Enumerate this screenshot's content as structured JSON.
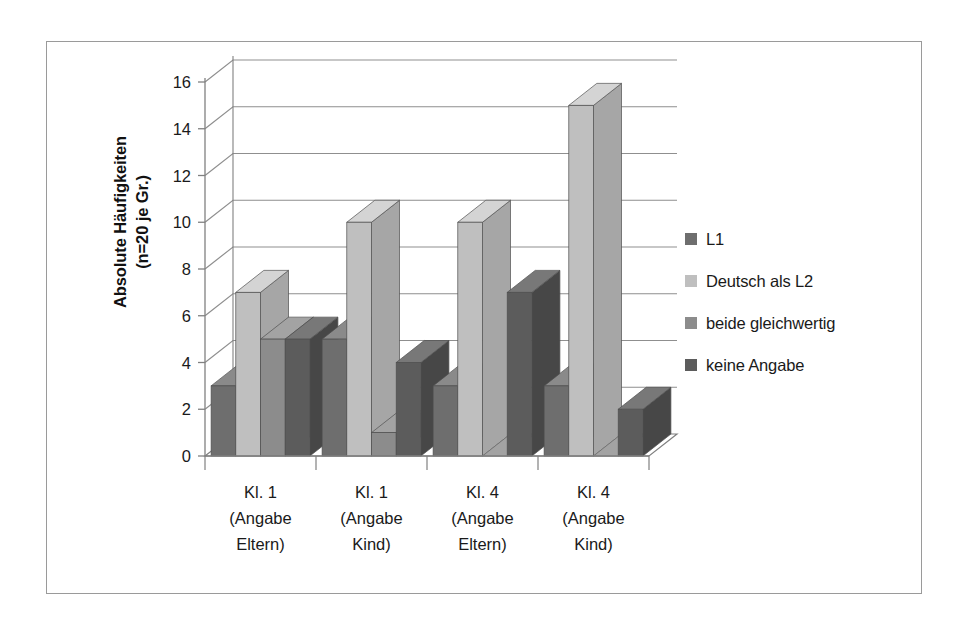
{
  "chart_data": {
    "type": "bar",
    "title": "",
    "subtitle": "",
    "xlabel": "",
    "ylabel": "Absolute Häufigkeiten (n=20 je Gr.)",
    "ylabel_lines": [
      "Absolute Häufigkeiten",
      "(n=20 je Gr.)"
    ],
    "categories": [
      "Kl. 1 (Angabe Eltern)",
      "Kl. 1 (Angabe Kind)",
      "Kl. 4 (Angabe Eltern)",
      "Kl. 4 (Angabe Kind)"
    ],
    "category_lines": [
      [
        "Kl. 1",
        "(Angabe",
        "Eltern)"
      ],
      [
        "Kl. 1",
        "(Angabe",
        "Kind)"
      ],
      [
        "Kl. 4",
        "(Angabe",
        "Eltern)"
      ],
      [
        "Kl. 4",
        "(Angabe",
        "Kind)"
      ]
    ],
    "series": [
      {
        "name": "L1",
        "color": "#6e6e6e",
        "side_color": "#5a5a5a",
        "top_color": "#8a8a8a",
        "values": [
          3,
          5,
          3,
          3
        ]
      },
      {
        "name": "Deutsch als L2",
        "color": "#bfbfbf",
        "side_color": "#a6a6a6",
        "top_color": "#d4d4d4",
        "values": [
          7,
          10,
          10,
          15
        ]
      },
      {
        "name": "beide gleichwertig",
        "color": "#8c8c8c",
        "side_color": "#757575",
        "top_color": "#a3a3a3",
        "values": [
          5,
          1,
          0,
          0
        ]
      },
      {
        "name": "keine Angabe",
        "color": "#5c5c5c",
        "side_color": "#474747",
        "top_color": "#787878",
        "values": [
          5,
          4,
          7,
          2
        ]
      }
    ],
    "ylim": [
      0,
      16
    ],
    "yticks": [
      0,
      2,
      4,
      6,
      8,
      10,
      12,
      14,
      16
    ],
    "ytick_labels": [
      "0",
      "2",
      "4",
      "6",
      "8",
      "10",
      "12",
      "14",
      "16"
    ],
    "grid": true,
    "grid_axis": "y",
    "legend_position": "right",
    "style": "3d-column",
    "frame_color": "#9a9a9a",
    "axis_color": "#808080",
    "grid_color": "#8f8f8f",
    "background": "#ffffff"
  },
  "legend": {
    "items": [
      {
        "label": "L1",
        "color": "#6e6e6e"
      },
      {
        "label": "Deutsch als L2",
        "color": "#bfbfbf"
      },
      {
        "label": "beide gleichwertig",
        "color": "#8c8c8c"
      },
      {
        "label": "keine Angabe",
        "color": "#5c5c5c"
      }
    ]
  }
}
